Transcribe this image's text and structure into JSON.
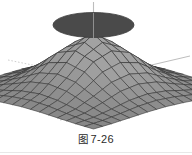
{
  "figure": {
    "caption_label": "图",
    "caption_number": "7-26",
    "caption_full": "图 7-26",
    "background_color": "#ffffff"
  },
  "colors": {
    "disk_fill": "#4a4a4a",
    "disk_stroke": "#3a3a3a",
    "axis_line": "#b8b8b8",
    "axis_line_dotted": "#c9c9c9",
    "mesh_line": "#2e2e2e",
    "facet_light": "#b9b9b9",
    "facet_mid": "#9a9a9a",
    "facet_dark": "#6f6f6f",
    "facet_darkest": "#4d4d4d",
    "caption_text": "#2b2b2b"
  },
  "chart_data": {
    "type": "surface",
    "subtitle": "",
    "xlabel": "",
    "ylabel": "",
    "zlabel": "",
    "grid": true,
    "legend": false,
    "legend_position": "none",
    "projection": "3d-axonometric",
    "surface_function": "gaussian bell: z = A*exp(-(x^2+y^2)/s)",
    "peak_amplitude": 1.0,
    "x": [
      -3,
      -2.25,
      -1.5,
      -0.75,
      0,
      0.75,
      1.5,
      2.25,
      3
    ],
    "y": [
      -3,
      -2.25,
      -1.5,
      -0.75,
      0,
      0.75,
      1.5,
      2.25,
      3
    ],
    "xlim": [
      -3,
      3
    ],
    "ylim": [
      -3,
      3
    ],
    "zlim": [
      0,
      1
    ],
    "z": [
      [
        0.01,
        0.02,
        0.04,
        0.06,
        0.07,
        0.06,
        0.04,
        0.02,
        0.01
      ],
      [
        0.02,
        0.05,
        0.11,
        0.18,
        0.21,
        0.18,
        0.11,
        0.05,
        0.02
      ],
      [
        0.04,
        0.11,
        0.25,
        0.41,
        0.47,
        0.41,
        0.25,
        0.11,
        0.04
      ],
      [
        0.06,
        0.18,
        0.41,
        0.68,
        0.79,
        0.68,
        0.41,
        0.18,
        0.06
      ],
      [
        0.07,
        0.21,
        0.47,
        0.79,
        1.0,
        0.79,
        0.47,
        0.21,
        0.07
      ],
      [
        0.06,
        0.18,
        0.41,
        0.68,
        0.79,
        0.68,
        0.41,
        0.18,
        0.06
      ],
      [
        0.04,
        0.11,
        0.25,
        0.41,
        0.47,
        0.41,
        0.25,
        0.11,
        0.04
      ],
      [
        0.02,
        0.05,
        0.11,
        0.18,
        0.21,
        0.18,
        0.11,
        0.05,
        0.02
      ],
      [
        0.01,
        0.02,
        0.04,
        0.06,
        0.07,
        0.06,
        0.04,
        0.02,
        0.01
      ]
    ],
    "annotations": [
      {
        "name": "floating-disk",
        "shape": "ellipse",
        "description": "dark filled ellipse floating above the surface peak",
        "center_z": 1.95,
        "radius_x": 2.0,
        "radius_y": 2.0,
        "fill": "#4a4a4a"
      },
      {
        "name": "vertical-axis",
        "shape": "line",
        "description": "vertical z axis through the peak and the disk",
        "color": "#b8b8b8"
      },
      {
        "name": "x-axis-line",
        "shape": "line",
        "description": "axis line receding to the lower right",
        "color": "#b8b8b8"
      },
      {
        "name": "y-axis-line",
        "shape": "line",
        "description": "axis line receding to the upper right",
        "color": "#b8b8b8"
      },
      {
        "name": "y-axis-dotted-line",
        "shape": "dotted-line",
        "description": "dotted axis line receding to the upper left",
        "color": "#c9c9c9"
      }
    ]
  }
}
